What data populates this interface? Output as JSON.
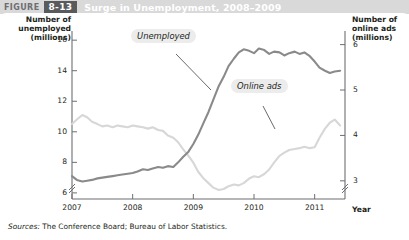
{
  "header": {
    "figure_word": "FIGURE",
    "figure_number": "8-13",
    "title": "Surge in Unemployment, 2008–2009",
    "bar_color": "#d9d9d9",
    "number_badge_color": "#595a5c"
  },
  "axes": {
    "left_caption": "Number of\nunemployed\n(millions)",
    "left_caption_lines": [
      "Number of",
      "unemployed",
      "(millions)"
    ],
    "right_caption_lines": [
      "Number of",
      "online ads",
      "(millions)"
    ],
    "x_caption": "Year",
    "left_ticks": [
      "16",
      "14",
      "12",
      "10",
      "8",
      "6"
    ],
    "right_ticks": [
      "6",
      "5",
      "4",
      "3"
    ],
    "x_ticks": [
      "2007",
      "2008",
      "2009",
      "2010",
      "2011"
    ],
    "left_axis_break": true,
    "right_axis_break": true
  },
  "series_labels": {
    "unemployed": "Unemployed",
    "online_ads": "Online ads"
  },
  "colors": {
    "unemployed_line": "#8a8a8a",
    "online_ads_line": "#d7d7d7",
    "axis": "#6d6e71",
    "callout_bg": "#ececec",
    "text": "#231f20"
  },
  "source": {
    "prefix": "Sources:",
    "text": "The Conference Board; Bureau of Labor Statistics."
  },
  "chart_data": {
    "type": "line",
    "title": "Surge in Unemployment, 2008–2009",
    "xlabel": "Year",
    "ylabel": "Number of unemployed (millions)",
    "y2label": "Number of online ads (millions)",
    "xlim": [
      2007.0,
      2011.5
    ],
    "ylim": [
      5.6,
      16.6
    ],
    "y2lim": [
      2.6,
      6.3
    ],
    "grid": false,
    "legend": "inline-callouts",
    "x": [
      2007.0,
      2007.08,
      2007.17,
      2007.25,
      2007.33,
      2007.42,
      2007.5,
      2007.58,
      2007.67,
      2007.75,
      2007.83,
      2007.92,
      2008.0,
      2008.08,
      2008.17,
      2008.25,
      2008.33,
      2008.42,
      2008.5,
      2008.58,
      2008.67,
      2008.75,
      2008.83,
      2008.92,
      2009.0,
      2009.08,
      2009.17,
      2009.25,
      2009.33,
      2009.42,
      2009.5,
      2009.58,
      2009.67,
      2009.75,
      2009.83,
      2009.92,
      2010.0,
      2010.08,
      2010.17,
      2010.25,
      2010.33,
      2010.42,
      2010.5,
      2010.58,
      2010.67,
      2010.75,
      2010.83,
      2010.92,
      2011.0,
      2011.08,
      2011.17,
      2011.25,
      2011.33,
      2011.42
    ],
    "series": [
      {
        "name": "Unemployed",
        "axis": "left",
        "units": "millions",
        "color": "#8a8a8a",
        "values": [
          7.1,
          6.85,
          6.75,
          6.8,
          6.85,
          6.95,
          7.0,
          7.05,
          7.1,
          7.15,
          7.2,
          7.25,
          7.3,
          7.4,
          7.55,
          7.5,
          7.6,
          7.7,
          7.65,
          7.75,
          7.7,
          8.0,
          8.35,
          8.7,
          9.2,
          9.8,
          10.6,
          11.3,
          12.1,
          13.0,
          13.6,
          14.3,
          14.8,
          15.2,
          15.4,
          15.3,
          15.15,
          15.45,
          15.35,
          15.1,
          15.25,
          15.2,
          15.0,
          15.15,
          15.25,
          15.1,
          15.2,
          14.95,
          14.6,
          14.2,
          14.0,
          13.85,
          13.95,
          14.0
        ],
        "start_value": 7.1,
        "peak_value": 15.45,
        "peak_x": 2010.08,
        "end_value": 14.0
      },
      {
        "name": "Online ads",
        "axis": "right",
        "units": "millions",
        "color": "#d7d7d7",
        "values": [
          4.25,
          4.35,
          4.45,
          4.4,
          4.3,
          4.25,
          4.2,
          4.22,
          4.18,
          4.22,
          4.2,
          4.18,
          4.22,
          4.2,
          4.18,
          4.15,
          4.18,
          4.12,
          4.1,
          4.0,
          3.95,
          3.85,
          3.7,
          3.55,
          3.4,
          3.2,
          3.05,
          2.95,
          2.85,
          2.8,
          2.82,
          2.88,
          2.92,
          2.9,
          2.95,
          3.05,
          3.1,
          3.08,
          3.15,
          3.25,
          3.4,
          3.55,
          3.62,
          3.68,
          3.7,
          3.72,
          3.75,
          3.72,
          3.74,
          3.95,
          4.15,
          4.28,
          4.35,
          4.22
        ],
        "start_value": 4.25,
        "trough_value": 2.8,
        "trough_x": 2009.42,
        "end_value": 4.22
      }
    ]
  }
}
